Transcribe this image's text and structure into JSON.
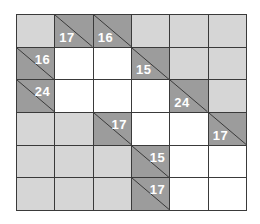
{
  "puzzle": {
    "type": "kakuro",
    "rows": 6,
    "cols": 6,
    "colors": {
      "blank": "#d6d6d6",
      "white": "#ffffff",
      "clue": "#9c9c9c",
      "line": "#3a3a3a",
      "clue_text": "#ffffff"
    },
    "cells": [
      [
        {
          "t": "blank"
        },
        {
          "t": "clue",
          "down": "17"
        },
        {
          "t": "clue",
          "down": "16"
        },
        {
          "t": "blank"
        },
        {
          "t": "blank"
        },
        {
          "t": "blank"
        }
      ],
      [
        {
          "t": "clue",
          "right": "16"
        },
        {
          "t": "white"
        },
        {
          "t": "white"
        },
        {
          "t": "clue",
          "down": "15"
        },
        {
          "t": "blank"
        },
        {
          "t": "blank"
        }
      ],
      [
        {
          "t": "clue",
          "right": "24"
        },
        {
          "t": "white"
        },
        {
          "t": "white"
        },
        {
          "t": "white"
        },
        {
          "t": "clue",
          "down": "24"
        },
        {
          "t": "blank"
        }
      ],
      [
        {
          "t": "blank"
        },
        {
          "t": "blank"
        },
        {
          "t": "clue",
          "right": "17"
        },
        {
          "t": "white"
        },
        {
          "t": "white"
        },
        {
          "t": "clue",
          "down": "17"
        }
      ],
      [
        {
          "t": "blank"
        },
        {
          "t": "blank"
        },
        {
          "t": "blank"
        },
        {
          "t": "clue",
          "right": "15"
        },
        {
          "t": "white"
        },
        {
          "t": "white"
        }
      ],
      [
        {
          "t": "blank"
        },
        {
          "t": "blank"
        },
        {
          "t": "blank"
        },
        {
          "t": "clue",
          "right": "17"
        },
        {
          "t": "white"
        },
        {
          "t": "white"
        }
      ]
    ]
  }
}
